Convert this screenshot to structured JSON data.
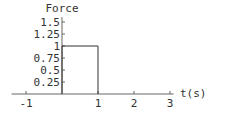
{
  "chart_data": {
    "type": "line",
    "title": "Force",
    "xlabel": "t(s)",
    "ylabel": "",
    "xlim": [
      -1.4,
      3.1
    ],
    "ylim": [
      0,
      1.6
    ],
    "grid": false,
    "x_ticks": [
      -1,
      1,
      2,
      3
    ],
    "x_tick_labels": [
      "-1",
      "1",
      "2",
      "3"
    ],
    "y_ticks": [
      0.25,
      0.5,
      0.75,
      1,
      1.25,
      1.5
    ],
    "y_tick_labels": [
      "0.25",
      "0.5",
      "0.75",
      "1",
      "1.25",
      "1.5"
    ],
    "series": [
      {
        "name": "Force",
        "x": [
          0,
          0,
          1,
          1
        ],
        "y": [
          0,
          1,
          1,
          0
        ]
      }
    ]
  }
}
